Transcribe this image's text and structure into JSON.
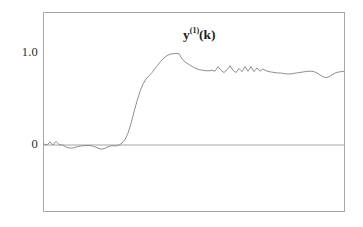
{
  "figure": {
    "background_color": "#ffffff",
    "frame_color": "#a8a8a8",
    "curve_color": "#8a8a8a",
    "zero_line_color": "#9a9a9a",
    "text_color": "#2b2b2b"
  },
  "labels": {
    "series_base": "y",
    "series_superscript": "(1)",
    "series_argument": "(k)",
    "tick_one": "1.0",
    "tick_zero": "0"
  },
  "chart_data": {
    "type": "line",
    "xlabel": "",
    "ylabel": "",
    "grid": false,
    "legend": null,
    "xlim": [
      0,
      100
    ],
    "ylim": [
      -0.72,
      1.44
    ],
    "yticks": [
      0,
      1.0
    ],
    "ytick_labels": [
      "0",
      "1.0"
    ],
    "xticks": [],
    "xtick_labels": [],
    "zero_reference_line": 0,
    "series": [
      {
        "name": "y^(1)(k)",
        "x": [
          0,
          1,
          2,
          3,
          4,
          5,
          6,
          7,
          8,
          9,
          10,
          11,
          12,
          13,
          14,
          15,
          16,
          17,
          18,
          19,
          20,
          21,
          22,
          23,
          24,
          25,
          26,
          27,
          28,
          29,
          30,
          31,
          32,
          33,
          34,
          35,
          36,
          37,
          38,
          39,
          40,
          41,
          42,
          43,
          44,
          45,
          46,
          47,
          48,
          49,
          50,
          51,
          52,
          53,
          54,
          55,
          56,
          57,
          58,
          59,
          60,
          61,
          62,
          63,
          64,
          65,
          66,
          67,
          68,
          69,
          70,
          71,
          72,
          73,
          74,
          75,
          76,
          77,
          78,
          79,
          80,
          81,
          82,
          83,
          84,
          85,
          86,
          87,
          88,
          89,
          90,
          91,
          92,
          93,
          94,
          95,
          96,
          97,
          98,
          99,
          100
        ],
        "y": [
          0.01,
          0.0,
          0.035,
          0.0,
          0.04,
          0.005,
          0.0,
          -0.015,
          -0.03,
          -0.035,
          -0.03,
          -0.02,
          -0.012,
          -0.008,
          -0.005,
          -0.005,
          -0.01,
          -0.02,
          -0.035,
          -0.045,
          -0.04,
          -0.025,
          -0.012,
          -0.008,
          -0.01,
          0.0,
          0.02,
          0.06,
          0.13,
          0.235,
          0.36,
          0.48,
          0.585,
          0.665,
          0.72,
          0.755,
          0.79,
          0.835,
          0.875,
          0.915,
          0.95,
          0.975,
          0.99,
          0.995,
          1.0,
          0.995,
          0.94,
          0.905,
          0.885,
          0.865,
          0.845,
          0.83,
          0.82,
          0.815,
          0.81,
          0.81,
          0.815,
          0.805,
          0.855,
          0.815,
          0.79,
          0.82,
          0.865,
          0.815,
          0.79,
          0.835,
          0.8,
          0.855,
          0.805,
          0.855,
          0.8,
          0.84,
          0.805,
          0.83,
          0.81,
          0.8,
          0.795,
          0.79,
          0.785,
          0.785,
          0.78,
          0.775,
          0.775,
          0.78,
          0.785,
          0.79,
          0.795,
          0.8,
          0.805,
          0.805,
          0.8,
          0.785,
          0.765,
          0.745,
          0.735,
          0.745,
          0.765,
          0.785,
          0.795,
          0.8,
          0.805
        ]
      }
    ]
  }
}
